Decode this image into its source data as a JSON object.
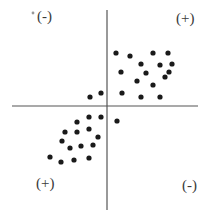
{
  "diagram": {
    "title": "",
    "quadrant_labels": {
      "top_left": "(-)",
      "top_right": "(+)",
      "bottom_left": "(+)",
      "bottom_right": "(-)"
    },
    "colors": {
      "axis": "#555555",
      "point": "#1a1a1a",
      "label": "#3a3a3a",
      "background": "#ffffff"
    }
  },
  "chart_data": {
    "type": "scatter",
    "title": "",
    "xlabel": "",
    "ylabel": "",
    "grid": false,
    "axes": "centered cross through origin",
    "note": "Positive-correlation scatter; quadrant signs indicate sign of product of deviations",
    "quadrant_labels": [
      "(-)",
      "(+)",
      "(+)",
      "(-)"
    ],
    "points_px": [
      [
        116,
        53
      ],
      [
        130,
        56
      ],
      [
        153,
        53
      ],
      [
        168,
        53
      ],
      [
        141,
        64
      ],
      [
        160,
        65
      ],
      [
        172,
        64
      ],
      [
        121,
        72
      ],
      [
        146,
        73
      ],
      [
        169,
        72
      ],
      [
        165,
        77
      ],
      [
        137,
        81
      ],
      [
        153,
        85
      ],
      [
        122,
        93
      ],
      [
        141,
        97
      ],
      [
        160,
        97
      ],
      [
        90,
        97
      ],
      [
        101,
        93
      ],
      [
        117,
        121
      ],
      [
        89,
        117
      ],
      [
        101,
        117
      ],
      [
        77,
        122
      ],
      [
        89,
        129
      ],
      [
        77,
        132
      ],
      [
        65,
        132
      ],
      [
        98,
        137
      ],
      [
        62,
        141
      ],
      [
        81,
        146
      ],
      [
        93,
        145
      ],
      [
        70,
        148
      ],
      [
        50,
        157
      ],
      [
        61,
        162
      ],
      [
        74,
        160
      ],
      [
        89,
        158
      ]
    ],
    "origin_px": [
      107,
      106
    ]
  }
}
